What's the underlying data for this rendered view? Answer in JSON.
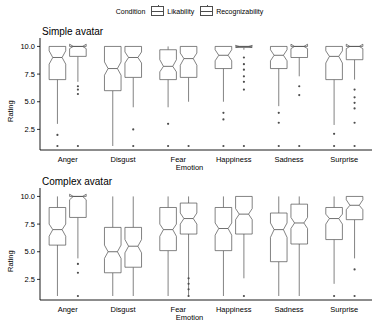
{
  "legend": {
    "title": "Condition",
    "items": [
      {
        "label": "Likability",
        "key": "likability-key"
      },
      {
        "label": "Recognizability",
        "key": "recognizability-key"
      }
    ]
  },
  "chart_data": {
    "type": "box",
    "title": "",
    "xlabel": "Emotion",
    "ylabel": "Rating",
    "ylim": [
      1,
      10.4
    ],
    "yticks": [
      2.5,
      5.0,
      7.5,
      10.0
    ],
    "ytick_labels": [
      "2.5",
      "5.0",
      "7.5",
      "10.0"
    ],
    "categories": [
      "Anger",
      "Disgust",
      "Fear",
      "Happiness",
      "Sadness",
      "Surprise"
    ],
    "grid": false,
    "legend_position": "top",
    "panels": [
      {
        "name": "Simple avatar",
        "series": [
          {
            "name": "Likability",
            "boxes": [
              {
                "category": "Anger",
                "lower": 3.0,
                "q1": 7.0,
                "median": 9.0,
                "q3": 10.0,
                "upper": 10.0,
                "notch_lo": 8.4,
                "notch_hi": 9.6,
                "outliers": [
                  2.0,
                  1.0
                ]
              },
              {
                "category": "Disgust",
                "lower": 1.0,
                "q1": 6.0,
                "median": 8.0,
                "q3": 10.0,
                "upper": 10.0,
                "notch_lo": 7.4,
                "notch_hi": 8.6,
                "outliers": []
              },
              {
                "category": "Fear",
                "lower": 4.5,
                "q1": 7.0,
                "median": 8.2,
                "q3": 9.7,
                "upper": 10.0,
                "notch_lo": 7.7,
                "notch_hi": 8.8,
                "outliers": [
                  3.0,
                  1.0
                ]
              },
              {
                "category": "Happiness",
                "lower": 5.0,
                "q1": 8.0,
                "median": 9.2,
                "q3": 10.0,
                "upper": 10.0,
                "notch_lo": 8.7,
                "notch_hi": 9.7,
                "outliers": [
                  4.0,
                  3.4,
                  1.0
                ]
              },
              {
                "category": "Sadness",
                "lower": 4.6,
                "q1": 8.0,
                "median": 9.2,
                "q3": 10.0,
                "upper": 10.0,
                "notch_lo": 8.7,
                "notch_hi": 9.7,
                "outliers": [
                  4.0,
                  3.1,
                  1.0
                ]
              },
              {
                "category": "Surprise",
                "lower": 2.9,
                "q1": 7.0,
                "median": 9.1,
                "q3": 10.0,
                "upper": 10.0,
                "notch_lo": 8.5,
                "notch_hi": 9.6,
                "outliers": [
                  2.1,
                  1.0
                ]
              }
            ]
          },
          {
            "name": "Recognizability",
            "boxes": [
              {
                "category": "Anger",
                "lower": 6.8,
                "q1": 9.1,
                "median": 10.0,
                "q3": 10.0,
                "upper": 10.0,
                "notch_lo": 9.8,
                "notch_hi": 10.2,
                "outliers": [
                  6.4,
                  6.1,
                  5.7,
                  1.0
                ]
              },
              {
                "category": "Disgust",
                "lower": 4.5,
                "q1": 7.2,
                "median": 9.0,
                "q3": 10.0,
                "upper": 10.0,
                "notch_lo": 8.5,
                "notch_hi": 9.5,
                "outliers": [
                  2.5,
                  1.0
                ]
              },
              {
                "category": "Fear",
                "lower": 5.0,
                "q1": 7.2,
                "median": 8.9,
                "q3": 10.0,
                "upper": 10.0,
                "notch_lo": 8.3,
                "notch_hi": 9.4,
                "outliers": [
                  1.0
                ]
              },
              {
                "category": "Happiness",
                "lower": 9.7,
                "q1": 9.9,
                "median": 10.0,
                "q3": 10.0,
                "upper": 10.0,
                "notch_lo": 9.9,
                "notch_hi": 10.1,
                "outliers": [
                  9.0,
                  8.4,
                  7.9,
                  7.3,
                  6.8,
                  6.1,
                  1.0
                ]
              },
              {
                "category": "Sadness",
                "lower": 7.3,
                "q1": 9.0,
                "median": 10.0,
                "q3": 10.0,
                "upper": 10.0,
                "notch_lo": 9.8,
                "notch_hi": 10.2,
                "outliers": [
                  6.4,
                  5.6,
                  1.0
                ]
              },
              {
                "category": "Surprise",
                "lower": 7.0,
                "q1": 8.8,
                "median": 10.0,
                "q3": 10.0,
                "upper": 10.0,
                "notch_lo": 9.8,
                "notch_hi": 10.2,
                "outliers": [
                  6.1,
                  5.4,
                  4.9,
                  4.4,
                  3.1,
                  1.0
                ]
              }
            ]
          }
        ]
      },
      {
        "name": "Complex avatar",
        "series": [
          {
            "name": "Likability",
            "boxes": [
              {
                "category": "Anger",
                "lower": 1.0,
                "q1": 5.6,
                "median": 7.0,
                "q3": 9.0,
                "upper": 10.0,
                "notch_lo": 6.4,
                "notch_hi": 7.5,
                "outliers": []
              },
              {
                "category": "Disgust",
                "lower": 1.0,
                "q1": 3.1,
                "median": 5.0,
                "q3": 7.2,
                "upper": 10.0,
                "notch_lo": 4.4,
                "notch_hi": 5.6,
                "outliers": []
              },
              {
                "category": "Fear",
                "lower": 1.0,
                "q1": 5.1,
                "median": 7.0,
                "q3": 9.0,
                "upper": 10.0,
                "notch_lo": 6.4,
                "notch_hi": 7.5,
                "outliers": []
              },
              {
                "category": "Happiness",
                "lower": 1.0,
                "q1": 5.1,
                "median": 7.1,
                "q3": 9.0,
                "upper": 10.0,
                "notch_lo": 6.5,
                "notch_hi": 7.6,
                "outliers": []
              },
              {
                "category": "Sadness",
                "lower": 1.0,
                "q1": 4.1,
                "median": 7.0,
                "q3": 8.5,
                "upper": 10.0,
                "notch_lo": 6.3,
                "notch_hi": 7.6,
                "outliers": []
              },
              {
                "category": "Surprise",
                "lower": 2.1,
                "q1": 6.1,
                "median": 8.0,
                "q3": 9.0,
                "upper": 10.0,
                "notch_lo": 7.5,
                "notch_hi": 8.4,
                "outliers": [
                  1.0
                ]
              }
            ]
          },
          {
            "name": "Recognizability",
            "boxes": [
              {
                "category": "Anger",
                "lower": 4.4,
                "q1": 8.1,
                "median": 10.0,
                "q3": 10.0,
                "upper": 10.0,
                "notch_lo": 9.7,
                "notch_hi": 10.2,
                "outliers": [
                  3.9,
                  3.1,
                  1.0
                ]
              },
              {
                "category": "Disgust",
                "lower": 1.0,
                "q1": 3.6,
                "median": 5.5,
                "q3": 7.2,
                "upper": 10.0,
                "notch_lo": 4.9,
                "notch_hi": 6.1,
                "outliers": []
              },
              {
                "category": "Fear",
                "lower": 1.0,
                "q1": 6.6,
                "median": 8.0,
                "q3": 9.4,
                "upper": 10.0,
                "notch_lo": 7.5,
                "notch_hi": 8.5,
                "outliers": [
                  2.6,
                  2.1,
                  1.6,
                  1.0
                ]
              },
              {
                "category": "Happiness",
                "lower": 2.6,
                "q1": 6.6,
                "median": 8.4,
                "q3": 10.0,
                "upper": 10.0,
                "notch_lo": 7.9,
                "notch_hi": 8.9,
                "outliers": [
                  1.0
                ]
              },
              {
                "category": "Sadness",
                "lower": 1.0,
                "q1": 5.7,
                "median": 7.6,
                "q3": 9.3,
                "upper": 10.0,
                "notch_lo": 7.1,
                "notch_hi": 8.1,
                "outliers": []
              },
              {
                "category": "Surprise",
                "lower": 4.4,
                "q1": 7.9,
                "median": 9.2,
                "q3": 10.0,
                "upper": 10.0,
                "notch_lo": 8.8,
                "notch_hi": 9.7,
                "outliers": [
                  3.4,
                  1.0
                ]
              }
            ]
          }
        ]
      }
    ]
  }
}
